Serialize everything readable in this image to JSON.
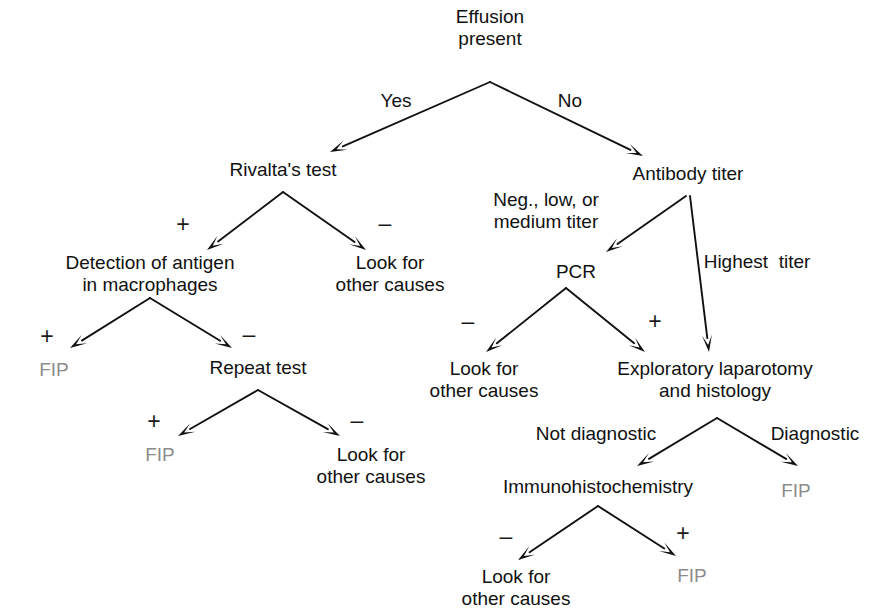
{
  "diagram": {
    "colors": {
      "line": "#111111",
      "text": "#111111",
      "terminal_fip": "#8c8c8c",
      "background": "#ffffff"
    },
    "nodes": [
      {
        "id": "effusion",
        "text": "Effusion\npresent",
        "x": 490,
        "y": 28,
        "kind": "decision"
      },
      {
        "id": "rivalta",
        "text": "Rivalta's test",
        "x": 283,
        "y": 170,
        "kind": "decision"
      },
      {
        "id": "antibody",
        "text": "Antibody titer",
        "x": 688,
        "y": 174,
        "kind": "decision"
      },
      {
        "id": "detection",
        "text": "Detection of antigen\nin macrophages",
        "x": 150,
        "y": 274,
        "kind": "decision"
      },
      {
        "id": "look1",
        "text": "Look for\nother causes",
        "x": 390,
        "y": 274,
        "kind": "outcome"
      },
      {
        "id": "pcr",
        "text": "PCR",
        "x": 576,
        "y": 272,
        "kind": "decision"
      },
      {
        "id": "fip1",
        "text": "FIP",
        "x": 54,
        "y": 370,
        "kind": "fip"
      },
      {
        "id": "repeat",
        "text": "Repeat test",
        "x": 258,
        "y": 368,
        "kind": "decision"
      },
      {
        "id": "look2",
        "text": "Look for\nother causes",
        "x": 484,
        "y": 380,
        "kind": "outcome"
      },
      {
        "id": "exploratory",
        "text": "Exploratory laparotomy\nand histology",
        "x": 715,
        "y": 380,
        "kind": "decision"
      },
      {
        "id": "fip2",
        "text": "FIP",
        "x": 160,
        "y": 455,
        "kind": "fip"
      },
      {
        "id": "look3",
        "text": "Look for\nother causes",
        "x": 371,
        "y": 466,
        "kind": "outcome"
      },
      {
        "id": "immuno",
        "text": "Immunohistochemistry",
        "x": 598,
        "y": 487,
        "kind": "decision"
      },
      {
        "id": "fip3",
        "text": "FIP",
        "x": 796,
        "y": 491,
        "kind": "fip"
      },
      {
        "id": "look4",
        "text": "Look for\nother causes",
        "x": 516,
        "y": 588,
        "kind": "outcome"
      },
      {
        "id": "fip4",
        "text": "FIP",
        "x": 692,
        "y": 576,
        "kind": "fip"
      }
    ],
    "edge_labels": [
      {
        "id": "yes",
        "text": "Yes",
        "x": 396,
        "y": 101
      },
      {
        "id": "no",
        "text": "No",
        "x": 570,
        "y": 101
      },
      {
        "id": "rivalta-plus",
        "text": "+",
        "x": 183,
        "y": 224,
        "sign": true
      },
      {
        "id": "rivalta-minus",
        "text": "–",
        "x": 385,
        "y": 223,
        "sign": true
      },
      {
        "id": "neg-low-med",
        "text": "Neg., low, or\nmedium titer",
        "x": 546,
        "y": 211
      },
      {
        "id": "highest-titer",
        "text": "Highest  titer",
        "x": 757,
        "y": 262
      },
      {
        "id": "det-plus",
        "text": "+",
        "x": 47,
        "y": 336,
        "sign": true
      },
      {
        "id": "det-minus",
        "text": "–",
        "x": 249,
        "y": 334,
        "sign": true
      },
      {
        "id": "pcr-minus",
        "text": "–",
        "x": 468,
        "y": 321,
        "sign": true
      },
      {
        "id": "pcr-plus",
        "text": "+",
        "x": 655,
        "y": 321,
        "sign": true
      },
      {
        "id": "rep-plus",
        "text": "+",
        "x": 154,
        "y": 421,
        "sign": true
      },
      {
        "id": "rep-minus",
        "text": "–",
        "x": 357,
        "y": 420,
        "sign": true
      },
      {
        "id": "not-diagnostic",
        "text": "Not diagnostic",
        "x": 596,
        "y": 434
      },
      {
        "id": "diagnostic",
        "text": "Diagnostic",
        "x": 815,
        "y": 434
      },
      {
        "id": "immuno-minus",
        "text": "–",
        "x": 506,
        "y": 536,
        "sign": true
      },
      {
        "id": "immuno-plus",
        "text": "+",
        "x": 683,
        "y": 533,
        "sign": true
      }
    ],
    "edges": [
      {
        "id": "effusion-to-rivalta",
        "from": "effusion",
        "to": "rivalta",
        "x1": 490,
        "y1": 82,
        "x2": 330,
        "y2": 152
      },
      {
        "id": "effusion-to-antibody",
        "from": "effusion",
        "to": "antibody",
        "x1": 490,
        "y1": 82,
        "x2": 643,
        "y2": 156
      },
      {
        "id": "rivalta-to-detection",
        "from": "rivalta",
        "to": "detection",
        "x1": 283,
        "y1": 192,
        "x2": 207,
        "y2": 250
      },
      {
        "id": "rivalta-to-look1",
        "from": "rivalta",
        "to": "look1",
        "x1": 283,
        "y1": 192,
        "x2": 366,
        "y2": 250
      },
      {
        "id": "antibody-to-pcr",
        "from": "antibody",
        "to": "pcr",
        "x1": 686,
        "y1": 196,
        "x2": 606,
        "y2": 252
      },
      {
        "id": "antibody-to-exploratory",
        "from": "antibody",
        "to": "exploratory",
        "x1": 690,
        "y1": 196,
        "x2": 709,
        "y2": 352
      },
      {
        "id": "detection-to-fip1",
        "from": "detection",
        "to": "fip1",
        "x1": 150,
        "y1": 298,
        "x2": 70,
        "y2": 348
      },
      {
        "id": "detection-to-repeat",
        "from": "detection",
        "to": "repeat",
        "x1": 150,
        "y1": 298,
        "x2": 232,
        "y2": 348
      },
      {
        "id": "pcr-to-look2",
        "from": "pcr",
        "to": "look2",
        "x1": 566,
        "y1": 288,
        "x2": 486,
        "y2": 352
      },
      {
        "id": "pcr-to-exploratory",
        "from": "pcr",
        "to": "exploratory",
        "x1": 566,
        "y1": 288,
        "x2": 645,
        "y2": 352
      },
      {
        "id": "repeat-to-fip2",
        "from": "repeat",
        "to": "fip2",
        "x1": 258,
        "y1": 390,
        "x2": 178,
        "y2": 436
      },
      {
        "id": "repeat-to-look3",
        "from": "repeat",
        "to": "look3",
        "x1": 258,
        "y1": 390,
        "x2": 340,
        "y2": 436
      },
      {
        "id": "exploratory-to-immuno",
        "from": "exploratory",
        "to": "immuno",
        "x1": 717,
        "y1": 418,
        "x2": 637,
        "y2": 466
      },
      {
        "id": "exploratory-to-fip3",
        "from": "exploratory",
        "to": "fip3",
        "x1": 717,
        "y1": 418,
        "x2": 798,
        "y2": 466
      },
      {
        "id": "immuno-to-look4",
        "from": "immuno",
        "to": "look4",
        "x1": 598,
        "y1": 506,
        "x2": 518,
        "y2": 560
      },
      {
        "id": "immuno-to-fip4",
        "from": "immuno",
        "to": "fip4",
        "x1": 598,
        "y1": 506,
        "x2": 676,
        "y2": 556
      }
    ]
  }
}
